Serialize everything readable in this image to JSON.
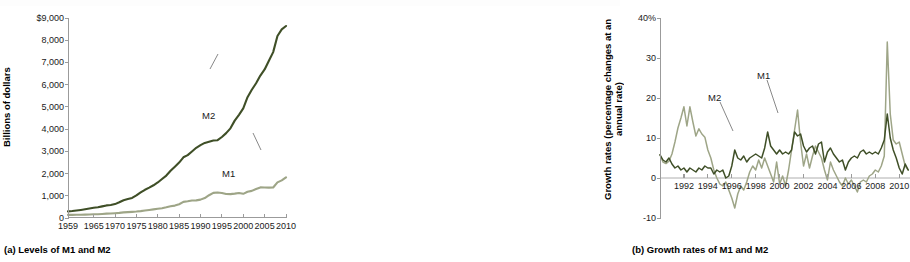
{
  "figure": {
    "panel_a_caption": "(a) Levels of M1 and M2",
    "panel_b_caption": "(b) Growth rates of M1 and M2"
  },
  "colors": {
    "m2_dark_green": "#3f4f27",
    "m1_light_sage": "#9ea587",
    "axis_gray": "#9b9b9b",
    "text_black": "#1a1a1a",
    "background": "#ffffff"
  },
  "panel_a": {
    "ylabel": "Billions of dollars",
    "ytick_labels": [
      "$9,000",
      "8,000",
      "7,000",
      "6,000",
      "5,000",
      "4,000",
      "3,000",
      "2,000",
      "1,000",
      "0"
    ],
    "xtick_labels": [
      "1959",
      "1965",
      "1970",
      "1975",
      "1980",
      "1985",
      "1990",
      "1995",
      "2000",
      "2005",
      "2010"
    ],
    "series_labels": {
      "m2": "M2",
      "m1": "M1"
    }
  },
  "panel_b": {
    "ylabel": "Growth rates (percentage changes at an annual rate)",
    "ytick_labels": [
      "40%",
      "30",
      "20",
      "10",
      "0",
      "-10"
    ],
    "xtick_labels": [
      "1992",
      "1994",
      "1996",
      "1998",
      "2000",
      "2002",
      "2004",
      "2006",
      "2008",
      "2010"
    ],
    "series_labels": {
      "m2": "M2",
      "m1": "M1"
    }
  },
  "chart_data": [
    {
      "type": "line",
      "id": "panel-a-levels",
      "title": "(a) Levels of M1 and M2",
      "xlabel": "",
      "ylabel": "Billions of dollars",
      "xlim": [
        1959,
        2010
      ],
      "ylim": [
        0,
        9000
      ],
      "ytick_values": [
        0,
        1000,
        2000,
        3000,
        4000,
        5000,
        6000,
        7000,
        8000,
        9000
      ],
      "xtick_values": [
        1959,
        1965,
        1970,
        1975,
        1980,
        1985,
        1990,
        1995,
        2000,
        2005,
        2010
      ],
      "grid": false,
      "legend": "inline-annotations",
      "x": [
        1959,
        1960,
        1961,
        1962,
        1963,
        1964,
        1965,
        1966,
        1967,
        1968,
        1969,
        1970,
        1971,
        1972,
        1973,
        1974,
        1975,
        1976,
        1977,
        1978,
        1979,
        1980,
        1981,
        1982,
        1983,
        1984,
        1985,
        1986,
        1987,
        1988,
        1989,
        1990,
        1991,
        1992,
        1993,
        1994,
        1995,
        1996,
        1997,
        1998,
        1999,
        2000,
        2001,
        2002,
        2003,
        2004,
        2005,
        2006,
        2007,
        2008,
        2009,
        2010
      ],
      "series": [
        {
          "name": "M2",
          "color": "#3f4f27",
          "values": [
            300,
            312,
            336,
            363,
            393,
            425,
            459,
            480,
            524,
            567,
            588,
            626,
            710,
            802,
            856,
            902,
            1016,
            1152,
            1270,
            1366,
            1473,
            1599,
            1755,
            1910,
            2126,
            2310,
            2495,
            2732,
            2831,
            2994,
            3158,
            3278,
            3379,
            3434,
            3487,
            3502,
            3645,
            3820,
            4035,
            4382,
            4643,
            4934,
            5436,
            5771,
            6063,
            6411,
            6685,
            7073,
            7465,
            8190,
            8490,
            8640
          ]
        },
        {
          "name": "M1",
          "color": "#9ea587",
          "values": [
            140,
            141,
            145,
            148,
            153,
            160,
            168,
            172,
            183,
            197,
            204,
            215,
            230,
            252,
            265,
            277,
            291,
            310,
            335,
            363,
            389,
            414,
            441,
            480,
            528,
            558,
            620,
            725,
            750,
            787,
            794,
            826,
            898,
            1025,
            1130,
            1150,
            1128,
            1081,
            1073,
            1096,
            1124,
            1088,
            1183,
            1220,
            1306,
            1376,
            1375,
            1367,
            1373,
            1603,
            1695,
            1830
          ]
        }
      ]
    },
    {
      "type": "line",
      "id": "panel-b-growth-rates",
      "title": "(b) Growth rates of M1 and M2",
      "xlabel": "",
      "ylabel": "Growth rates (percentage changes at an annual rate)",
      "xlim": [
        1990.0,
        2010.9
      ],
      "ylim": [
        -10,
        40
      ],
      "ytick_values": [
        -10,
        0,
        10,
        20,
        30,
        40
      ],
      "xtick_values": [
        1992,
        1994,
        1996,
        1998,
        2000,
        2002,
        2004,
        2006,
        2008,
        2010
      ],
      "grid": false,
      "legend": "inline-annotations",
      "x": [
        1990.0,
        1990.25,
        1990.5,
        1990.75,
        1991.0,
        1991.25,
        1991.5,
        1991.75,
        1992.0,
        1992.25,
        1992.5,
        1992.75,
        1993.0,
        1993.25,
        1993.5,
        1993.75,
        1994.0,
        1994.25,
        1994.5,
        1994.75,
        1995.0,
        1995.25,
        1995.5,
        1995.75,
        1996.0,
        1996.25,
        1996.5,
        1996.75,
        1997.0,
        1997.25,
        1997.5,
        1997.75,
        1998.0,
        1998.25,
        1998.5,
        1998.75,
        1999.0,
        1999.25,
        1999.5,
        1999.75,
        2000.0,
        2000.25,
        2000.5,
        2000.75,
        2001.0,
        2001.25,
        2001.5,
        2001.75,
        2002.0,
        2002.25,
        2002.5,
        2002.75,
        2003.0,
        2003.25,
        2003.5,
        2003.75,
        2004.0,
        2004.25,
        2004.5,
        2004.75,
        2005.0,
        2005.25,
        2005.5,
        2005.75,
        2006.0,
        2006.25,
        2006.5,
        2006.75,
        2007.0,
        2007.25,
        2007.5,
        2007.75,
        2008.0,
        2008.25,
        2008.5,
        2008.75,
        2009.0,
        2009.25,
        2009.5,
        2009.75,
        2010.0,
        2010.25,
        2010.5,
        2010.75
      ],
      "series": [
        {
          "name": "M1",
          "color": "#9ea587",
          "values": [
            5.8,
            4.0,
            3.6,
            4.2,
            6.0,
            9.0,
            12.5,
            15.0,
            17.8,
            13.0,
            17.8,
            14.0,
            10.5,
            12.3,
            11.0,
            10.2,
            7.0,
            5.0,
            2.0,
            0.0,
            -1.5,
            -2.0,
            -1.0,
            -3.0,
            -5.0,
            -7.5,
            -4.0,
            -2.0,
            -3.0,
            -1.0,
            1.5,
            3.0,
            2.0,
            4.5,
            2.5,
            5.0,
            3.0,
            1.0,
            -1.0,
            4.0,
            -1.5,
            0.5,
            -2.0,
            2.0,
            7.0,
            12.0,
            17.0,
            9.0,
            3.0,
            6.0,
            2.5,
            5.5,
            8.0,
            6.5,
            5.0,
            2.0,
            -0.5,
            4.0,
            2.0,
            0.5,
            -1.0,
            -2.0,
            0.0,
            -1.5,
            -0.5,
            -2.0,
            -3.5,
            -1.0,
            -0.5,
            -1.0,
            0.5,
            1.0,
            2.0,
            1.5,
            3.0,
            5.5,
            34.0,
            16.0,
            9.5,
            8.5,
            9.0,
            6.0,
            3.0,
            2.0,
            3.5
          ]
        },
        {
          "name": "M2",
          "color": "#3f4f27",
          "values": [
            5.8,
            4.5,
            4.0,
            5.0,
            3.5,
            2.5,
            3.0,
            2.0,
            2.5,
            1.5,
            2.5,
            2.0,
            1.5,
            2.5,
            2.0,
            3.0,
            2.5,
            2.5,
            1.0,
            2.0,
            1.5,
            2.0,
            0.0,
            0.5,
            3.0,
            7.0,
            5.0,
            4.5,
            5.5,
            4.0,
            5.0,
            5.5,
            6.0,
            5.5,
            5.0,
            7.5,
            11.5,
            8.0,
            7.0,
            6.0,
            7.0,
            6.0,
            6.5,
            6.0,
            7.0,
            11.5,
            10.5,
            11.0,
            8.0,
            6.5,
            7.5,
            8.0,
            6.0,
            8.5,
            9.0,
            4.0,
            6.5,
            7.5,
            6.0,
            5.0,
            4.0,
            4.5,
            2.0,
            4.0,
            5.0,
            5.5,
            5.0,
            6.5,
            7.0,
            6.0,
            6.5,
            6.0,
            6.5,
            6.0,
            7.5,
            9.5,
            16.0,
            10.0,
            7.0,
            5.0,
            2.5,
            1.0,
            3.5,
            2.0
          ]
        }
      ]
    }
  ]
}
